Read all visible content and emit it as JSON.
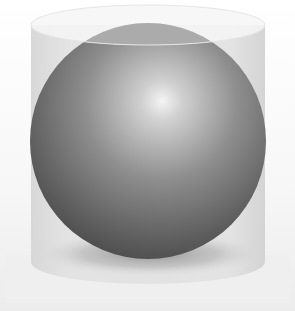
{
  "scene": {
    "description": "Gray shaded sphere inscribed in a translucent cylinder",
    "colors": {
      "background": "#ffffff",
      "cylinder_body": "#dedede",
      "cylinder_top": "#f4f4f4",
      "sphere_highlight": "#f2f2f2",
      "sphere_mid": "#9a9a9a",
      "sphere_dark": "#4a4a4a",
      "shadow": "#8c8c8c"
    },
    "shapes": {
      "cylinder": {
        "left": 31,
        "right": 265,
        "top_cy": 25,
        "ry": 20,
        "bottom": 272
      },
      "sphere": {
        "cx": 148,
        "cy": 141,
        "r": 118,
        "highlight_x": 160,
        "highlight_y": 100
      }
    }
  }
}
